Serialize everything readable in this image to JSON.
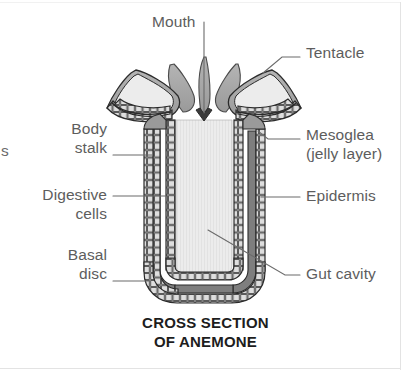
{
  "figure": {
    "caption_line1": "CROSS SECTION",
    "caption_line2": "OF ANEMONE",
    "edge_text_fragment": "s",
    "colors": {
      "outline": "#2b2b2b",
      "label_text": "#5d5d5d",
      "caption_text": "#1d1d1d",
      "leader_line": "#6b6b6b",
      "tentacle_fill": "#a8a8a8",
      "mesoglea_fill": "#8f8f8f",
      "cell_fill": "#d9d9d9",
      "gut_cavity_fill": "#ebebeb",
      "page_rule": "#e3e3e3",
      "background": "#ffffff"
    }
  },
  "labels": {
    "mouth": {
      "text": "Mouth",
      "side": "top"
    },
    "tentacle": {
      "text": "Tentacle",
      "side": "right"
    },
    "mesoglea_line1": {
      "text": "Mesoglea",
      "side": "right"
    },
    "mesoglea_line2": {
      "text": "(jelly layer)",
      "side": "right"
    },
    "epidermis": {
      "text": "Epidermis",
      "side": "right"
    },
    "gut_cavity": {
      "text": "Gut cavity",
      "side": "right"
    },
    "body_stalk_line1": {
      "text": "Body",
      "side": "left"
    },
    "body_stalk_line2": {
      "text": "stalk",
      "side": "left"
    },
    "digestive_cells_line1": {
      "text": "Digestive",
      "side": "left"
    },
    "digestive_cells_line2": {
      "text": "cells",
      "side": "left"
    },
    "basal_disc_line1": {
      "text": "Basal",
      "side": "left"
    },
    "basal_disc_line2": {
      "text": "disc",
      "side": "left"
    }
  },
  "anatomy_parts": [
    "Mouth",
    "Tentacle",
    "Mesoglea (jelly layer)",
    "Epidermis",
    "Gut cavity",
    "Body stalk",
    "Digestive cells",
    "Basal disc"
  ]
}
